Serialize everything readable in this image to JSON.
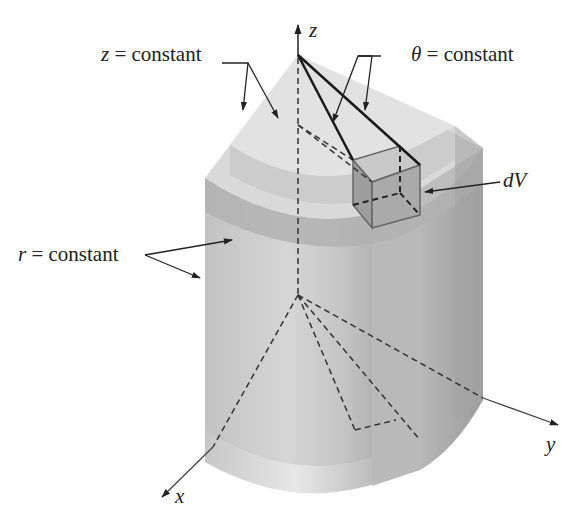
{
  "figure": {
    "axes": {
      "z_label": "z",
      "x_label": "x",
      "y_label": "y"
    },
    "labels": {
      "z_constant": {
        "var": "z",
        "text": " = constant"
      },
      "theta_constant": {
        "var": "θ",
        "text": " = constant"
      },
      "r_constant": {
        "var": "r",
        "text": " = constant"
      },
      "dV": "dV"
    },
    "colors": {
      "background": "#ffffff",
      "solid_light": "#d4d4d4",
      "solid_mid": "#bdbdbd",
      "solid_dark": "#a8a8a8",
      "band": "#b2b2b2",
      "line": "#222222"
    }
  }
}
